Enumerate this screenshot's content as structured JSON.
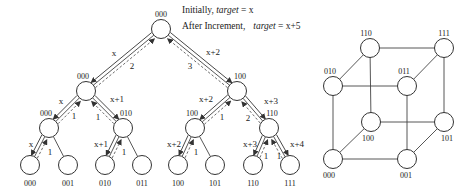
{
  "caption": {
    "line1_prefix": "Initially, ",
    "line1_var": "target",
    "line1_suffix": " = x",
    "line2_prefix": "After Increment,",
    "line2_var": "target",
    "line2_suffix": " = x+5"
  },
  "tree": {
    "radius": 9.5,
    "nodes": [
      {
        "id": "r",
        "x": 161,
        "y": 29,
        "label": "000",
        "lx": 161,
        "ly": 17
      },
      {
        "id": "a",
        "x": 86,
        "y": 91,
        "label": "000",
        "lx": 83,
        "ly": 79
      },
      {
        "id": "b",
        "x": 237,
        "y": 91,
        "label": "100",
        "lx": 240,
        "ly": 79
      },
      {
        "id": "aa",
        "x": 49,
        "y": 128,
        "label": "000",
        "lx": 46,
        "ly": 116
      },
      {
        "id": "ab",
        "x": 123,
        "y": 128,
        "label": "010",
        "lx": 126,
        "ly": 116
      },
      {
        "id": "ba",
        "x": 195,
        "y": 128,
        "label": "100",
        "lx": 192,
        "ly": 116
      },
      {
        "id": "bb",
        "x": 269,
        "y": 128,
        "label": "110",
        "lx": 272,
        "ly": 116
      },
      {
        "id": "l0",
        "x": 30,
        "y": 165,
        "label": "000",
        "lx": 30,
        "ly": 186
      },
      {
        "id": "l1",
        "x": 68,
        "y": 165,
        "label": "001",
        "lx": 68,
        "ly": 186
      },
      {
        "id": "l2",
        "x": 105,
        "y": 165,
        "label": "010",
        "lx": 105,
        "ly": 186
      },
      {
        "id": "l3",
        "x": 142,
        "y": 165,
        "label": "011",
        "lx": 142,
        "ly": 186
      },
      {
        "id": "l4",
        "x": 178,
        "y": 165,
        "label": "100",
        "lx": 178,
        "ly": 186
      },
      {
        "id": "l5",
        "x": 215,
        "y": 165,
        "label": "101",
        "lx": 215,
        "ly": 186
      },
      {
        "id": "l6",
        "x": 253,
        "y": 165,
        "label": "110",
        "lx": 253,
        "ly": 186
      },
      {
        "id": "l7",
        "x": 290,
        "y": 165,
        "label": "111",
        "lx": 290,
        "ly": 186
      }
    ],
    "edges": [
      {
        "from": "r",
        "to": "a",
        "request": "x",
        "reply": "2",
        "req_pos": [
          114,
          56
        ],
        "rep_pos": [
          132,
          69
        ]
      },
      {
        "from": "r",
        "to": "b",
        "request": "x+2",
        "reply": "3",
        "req_pos": [
          213,
          55
        ],
        "rep_pos": [
          190,
          69
        ]
      },
      {
        "from": "a",
        "to": "aa",
        "request": "x",
        "reply": "1",
        "req_pos": [
          61,
          104
        ],
        "rep_pos": [
          74,
          119
        ]
      },
      {
        "from": "a",
        "to": "ab",
        "request": "x+1",
        "reply": "1",
        "req_pos": [
          117,
          102
        ],
        "rep_pos": [
          98,
          120
        ]
      },
      {
        "from": "b",
        "to": "ba",
        "request": "x+2",
        "reply": "1",
        "req_pos": [
          206,
          102
        ],
        "rep_pos": [
          222,
          120
        ]
      },
      {
        "from": "b",
        "to": "bb",
        "request": "x+3",
        "reply": "2",
        "req_pos": [
          271,
          104
        ],
        "rep_pos": [
          248,
          121
        ]
      },
      {
        "from": "aa",
        "to": "l0",
        "request": "x",
        "reply": "1",
        "req_pos": [
          31,
          147
        ],
        "rep_pos": [
          50,
          155
        ]
      },
      {
        "from": "aa",
        "to": "l1",
        "request": null,
        "reply": null
      },
      {
        "from": "ab",
        "to": "l2",
        "request": "x+1",
        "reply": "1",
        "req_pos": [
          101,
          147
        ],
        "rep_pos": [
          124,
          155
        ]
      },
      {
        "from": "ab",
        "to": "l3",
        "request": null,
        "reply": null
      },
      {
        "from": "ba",
        "to": "l4",
        "request": "x+2",
        "reply": "1",
        "req_pos": [
          174,
          147
        ],
        "rep_pos": [
          196,
          155
        ]
      },
      {
        "from": "ba",
        "to": "l5",
        "request": null,
        "reply": null
      },
      {
        "from": "bb",
        "to": "l6",
        "request": "x+3",
        "reply": "1",
        "req_pos": [
          250,
          147
        ],
        "rep_pos": [
          266,
          159
        ]
      },
      {
        "from": "bb",
        "to": "l7",
        "request": "x+4",
        "reply": "1",
        "req_pos": [
          297,
          147
        ],
        "rep_pos": [
          279,
          159
        ]
      }
    ]
  },
  "hypercube": {
    "radius": 9.5,
    "nodes": [
      {
        "id": "000",
        "x": 333,
        "y": 159,
        "label": "000",
        "lx": 329,
        "ly": 178
      },
      {
        "id": "001",
        "x": 407,
        "y": 159,
        "label": "001",
        "lx": 406,
        "ly": 178
      },
      {
        "id": "010",
        "x": 333,
        "y": 86,
        "label": "010",
        "lx": 330,
        "ly": 74
      },
      {
        "id": "011",
        "x": 407,
        "y": 86,
        "label": "011",
        "lx": 404,
        "ly": 74
      },
      {
        "id": "100",
        "x": 371,
        "y": 122,
        "label": "100",
        "lx": 368,
        "ly": 141
      },
      {
        "id": "101",
        "x": 444,
        "y": 122,
        "label": "101",
        "lx": 447,
        "ly": 141
      },
      {
        "id": "110",
        "x": 370,
        "y": 48,
        "label": "110",
        "lx": 366,
        "ly": 36
      },
      {
        "id": "111",
        "x": 444,
        "y": 48,
        "label": "111",
        "lx": 444,
        "ly": 36
      }
    ],
    "edges": [
      [
        "000",
        "001"
      ],
      [
        "000",
        "010"
      ],
      [
        "000",
        "100"
      ],
      [
        "001",
        "011"
      ],
      [
        "001",
        "101"
      ],
      [
        "010",
        "011"
      ],
      [
        "010",
        "110"
      ],
      [
        "011",
        "111"
      ],
      [
        "100",
        "101"
      ],
      [
        "100",
        "110"
      ],
      [
        "101",
        "111"
      ],
      [
        "110",
        "111"
      ]
    ]
  }
}
